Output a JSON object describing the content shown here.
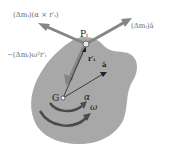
{
  "diagram": {
    "type": "rigid-body-kinetics",
    "colors": {
      "body_fill": "#a8a8a8",
      "arrow_gray": "#858585",
      "thin_line": "#222222",
      "rotation_arrow": "#4a4a4a",
      "label_gray": "#6a6a6a",
      "label_dark": "#222222"
    },
    "labels": {
      "tangential_force": "(Δmᵢ)(α × r′ᵢ)",
      "translational_force": "(Δmᵢ)ā",
      "centripetal_force": "−(Δmᵢ)ω²r′ᵢ",
      "point_p": "Pᵢ",
      "position_vector": "r′ᵢ",
      "acceleration_vector": "ā",
      "center_of_mass": "G",
      "angular_acceleration": "α",
      "angular_velocity": "ω"
    },
    "points": {
      "P": [
        86,
        44
      ],
      "G": [
        63,
        98
      ]
    }
  }
}
